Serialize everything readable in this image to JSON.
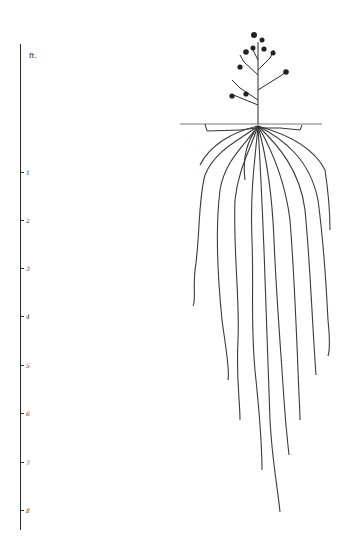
{
  "diagram": {
    "scale": {
      "unit_label": "ft.",
      "ticks": [
        {
          "label": "1",
          "y": 172
        },
        {
          "label": "2",
          "y": 220
        },
        {
          "label": "3",
          "y": 268
        },
        {
          "label": "4",
          "y": 316
        },
        {
          "label": "5",
          "y": 365
        },
        {
          "label": "6",
          "y": 413
        },
        {
          "label": "7",
          "y": 462
        },
        {
          "label": "8",
          "y": 510
        }
      ]
    },
    "colors": {
      "ink": "#2a2a2a",
      "root_ink": "#3a3a3a",
      "background": "#ffffff"
    }
  }
}
